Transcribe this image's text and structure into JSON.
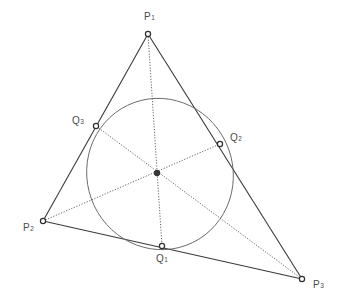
{
  "diagram": {
    "type": "geometry",
    "colors": {
      "line": "#3a3a3a",
      "dotted": "#555555",
      "ellipse": "#6a6a6a",
      "label": "#4a4a4a",
      "background": "#ffffff"
    },
    "vertices": [
      {
        "id": "P1",
        "name": "P",
        "sub": "1",
        "x": 148,
        "y": 34,
        "label_x": 144,
        "label_y": 20
      },
      {
        "id": "P2",
        "name": "P",
        "sub": "2",
        "x": 43,
        "y": 221,
        "label_x": 23,
        "label_y": 231
      },
      {
        "id": "P3",
        "name": "P",
        "sub": "3",
        "x": 302,
        "y": 279,
        "label_x": 313,
        "label_y": 288
      }
    ],
    "tangent_points": [
      {
        "id": "Q1",
        "name": "Q",
        "sub": "1",
        "x": 162,
        "y": 246,
        "label_x": 156,
        "label_y": 262
      },
      {
        "id": "Q2",
        "name": "Q",
        "sub": "2",
        "x": 220,
        "y": 144,
        "label_x": 230,
        "label_y": 141
      },
      {
        "id": "Q3",
        "name": "Q",
        "sub": "3",
        "x": 96,
        "y": 126,
        "label_x": 72,
        "label_y": 124
      }
    ],
    "center": {
      "id": "G",
      "x": 157,
      "y": 173
    },
    "ellipse": {
      "cx": 160,
      "cy": 174,
      "rx": 73,
      "ry": 76,
      "rotation": -20
    },
    "segments": {
      "sides": [
        [
          "P1",
          "P2"
        ],
        [
          "P2",
          "P3"
        ],
        [
          "P3",
          "P1"
        ]
      ],
      "cevians": [
        [
          "P1",
          "Q1"
        ],
        [
          "P2",
          "Q2"
        ],
        [
          "P3",
          "Q3"
        ]
      ]
    }
  }
}
